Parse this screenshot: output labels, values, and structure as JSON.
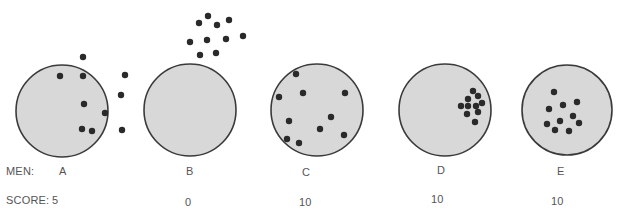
{
  "figure": {
    "colors": {
      "target_fill": "#d8d8d8",
      "target_stroke": "#3a3a3a",
      "shot": "#2a2a2a",
      "text": "#555555"
    }
  },
  "labels": {
    "men_prefix": "MEN:",
    "score_prefix": "SCORE:"
  },
  "targets": [
    {
      "man": "A",
      "score": "5",
      "circle": {
        "cx": 62,
        "cy": 111,
        "r": 46
      },
      "shots": [
        [
          60,
          76
        ],
        [
          83,
          76
        ],
        [
          83,
          57
        ],
        [
          125,
          75
        ],
        [
          121,
          95
        ],
        [
          84,
          104
        ],
        [
          105,
          113
        ],
        [
          82,
          129
        ],
        [
          92,
          131
        ],
        [
          122,
          130
        ]
      ]
    },
    {
      "man": "B",
      "score": "0",
      "circle": {
        "cx": 190,
        "cy": 110,
        "r": 46
      },
      "shots": [
        [
          208,
          16
        ],
        [
          199,
          23
        ],
        [
          217,
          25
        ],
        [
          229,
          20
        ],
        [
          190,
          42
        ],
        [
          207,
          40
        ],
        [
          226,
          39
        ],
        [
          243,
          36
        ],
        [
          200,
          55
        ],
        [
          216,
          53
        ]
      ]
    },
    {
      "man": "C",
      "score": "10",
      "circle": {
        "cx": 317,
        "cy": 110,
        "r": 46
      },
      "shots": [
        [
          296,
          74
        ],
        [
          303,
          93
        ],
        [
          279,
          97
        ],
        [
          345,
          93
        ],
        [
          289,
          121
        ],
        [
          331,
          117
        ],
        [
          320,
          129
        ],
        [
          287,
          139
        ],
        [
          299,
          143
        ],
        [
          344,
          135
        ]
      ]
    },
    {
      "man": "D",
      "score": "10",
      "circle": {
        "cx": 445,
        "cy": 110,
        "r": 46
      },
      "shots": [
        [
          473,
          91
        ],
        [
          478,
          96
        ],
        [
          468,
          99
        ],
        [
          482,
          103
        ],
        [
          461,
          106
        ],
        [
          468,
          106
        ],
        [
          476,
          106
        ],
        [
          467,
          114
        ],
        [
          478,
          112
        ],
        [
          475,
          122
        ]
      ]
    },
    {
      "man": "E",
      "score": "10",
      "circle": {
        "cx": 567,
        "cy": 110,
        "r": 45
      },
      "shots": [
        [
          554,
          92
        ],
        [
          549,
          109
        ],
        [
          563,
          105
        ],
        [
          577,
          102
        ],
        [
          573,
          116
        ],
        [
          560,
          121
        ],
        [
          547,
          124
        ],
        [
          555,
          130
        ],
        [
          569,
          131
        ],
        [
          579,
          123
        ]
      ]
    }
  ]
}
